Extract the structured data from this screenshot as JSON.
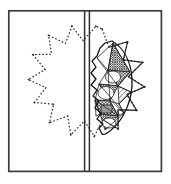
{
  "figure": {
    "type": "technical-line-drawing",
    "canvas": {
      "width": 171,
      "height": 184,
      "background": "#ffffff"
    },
    "colors": {
      "ink": "#1a1a1a",
      "frame": "#3c3c3c",
      "hatch": "#2b2b2b",
      "cell_fill": "#9a9a9a",
      "background": "#ffffff"
    },
    "frame": {
      "name": "outer-rectangle-border",
      "x": 8,
      "y": 10,
      "width": 154,
      "height": 162,
      "stroke_width": 1.6,
      "fill": "none"
    },
    "axis": {
      "name": "vertical-double-axis",
      "x1": 84.5,
      "x2": 89.5,
      "y_top": 10,
      "y_bottom": 172,
      "line_count": 2,
      "stroke_width": 1.5
    },
    "star": {
      "name": "dotted-twelve-point-star",
      "center_x": 86,
      "center_y": 90,
      "outer_radius": 63,
      "inner_radius": 44,
      "points": 12,
      "rotation_deg": 15,
      "stroke_style": "dotted",
      "stroke_width": 1.1,
      "fill": "none"
    },
    "vesica": {
      "name": "almond-vesica-leaf",
      "description": "Tilted almond / leaf shape spanning the right half, left edge jagged",
      "top_x": 112,
      "top_y": 41,
      "bottom_x": 103,
      "bottom_y": 134,
      "left_bulge_x": 90,
      "right_bulge_x": 130,
      "stroke_width": 1.2
    },
    "hatching": {
      "name": "crosshatched-cell-network",
      "cell_count": 7,
      "hatch_spacing": 1.7,
      "hatch_angles_deg": [
        45,
        -45
      ],
      "description": "Dense crosshatched triangular and lens cells filling the right lobe"
    }
  }
}
